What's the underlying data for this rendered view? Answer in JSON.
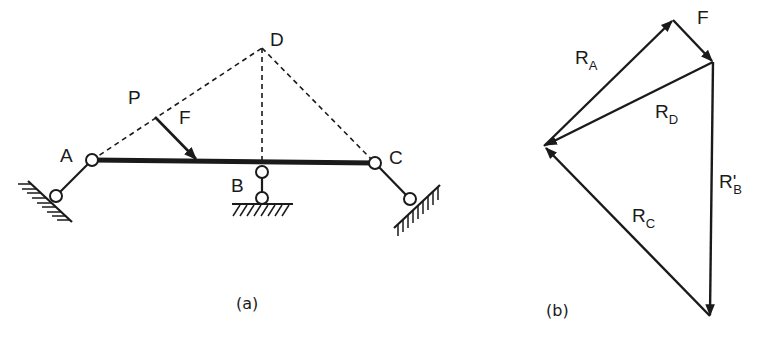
{
  "figure_a": {
    "caption": "(a)",
    "points": {
      "A": "A",
      "B": "B",
      "C": "C",
      "D": "D",
      "P": "P"
    },
    "force_label": "F"
  },
  "figure_b": {
    "caption": "(b)",
    "vectors": {
      "RA": {
        "main": "R",
        "sub": "A"
      },
      "F": {
        "main": "F"
      },
      "RD": {
        "main": "R",
        "sub": "D"
      },
      "RB": {
        "main": "R'",
        "sub": "B"
      },
      "RC": {
        "main": "R",
        "sub": "C"
      }
    }
  },
  "colors": {
    "ink": "#1a1a1a",
    "background": "#ffffff"
  }
}
